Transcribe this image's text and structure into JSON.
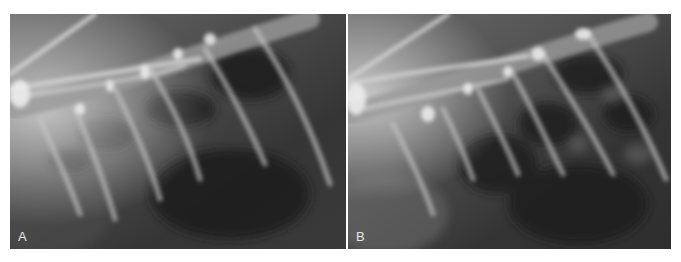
{
  "figure": {
    "panels": [
      {
        "id": "A",
        "label": "A",
        "content": "lateral thoracic radiograph"
      },
      {
        "id": "B",
        "label": "B",
        "content": "lateral thoracic radiograph"
      }
    ]
  },
  "colors": {
    "background": "#ffffff",
    "film_dark": "#2e2e2e",
    "bone_bright": "#e8e8e8",
    "label": "#e6e6e6"
  }
}
